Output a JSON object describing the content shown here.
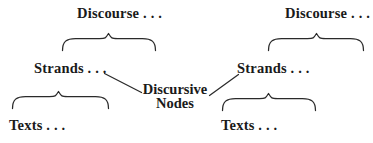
{
  "figure": {
    "background_color": "#ffffff",
    "ink_color": "#1a1a1a",
    "center_node": {
      "line1": "Discursive",
      "line2": "Nodes"
    },
    "left_branch": {
      "discourse_label": "Discourse . . .",
      "strands_label": "Strands . . .",
      "texts_label": "Texts . . ."
    },
    "right_branch": {
      "discourse_label": "Discourse . . .",
      "strands_label": "Strands . . .",
      "texts_label": "Texts . . ."
    }
  }
}
